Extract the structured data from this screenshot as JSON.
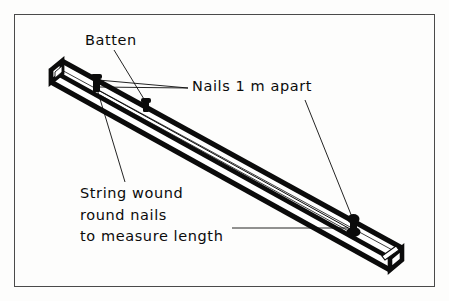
{
  "figure": {
    "title_absent": true,
    "type": "technical-line-diagram",
    "frame": {
      "border_color": "#4a4a4a",
      "background": "#fdfdfc"
    },
    "ink_color": "#0b0b0b",
    "labels": {
      "batten": "Batten",
      "nails": "Nails 1 m apart",
      "string_line1": "String wound",
      "string_line2": "round nails",
      "string_line3": "to measure length"
    },
    "parts": {
      "batten_description": "long rectangular timber batten drawn in oblique projection running from upper-left to lower-right",
      "nail_count": 3,
      "nail_positions": [
        "near upper-left end",
        "upper-middle",
        "near lower-right end"
      ],
      "string_description": "thin line running along the batten from the first nail to the last nail"
    }
  }
}
